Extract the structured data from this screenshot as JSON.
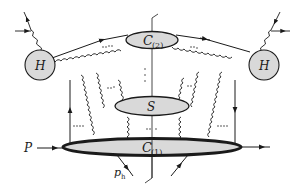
{
  "diagram": {
    "colors": {
      "line": "#1a1a1a",
      "blob_fill": "#d9d9d9",
      "background": "#ffffff"
    },
    "nodes": {
      "hard_left": {
        "label": "H"
      },
      "hard_right": {
        "label": "H"
      },
      "collinear_2": {
        "label": "C",
        "subscript": "(2)"
      },
      "soft": {
        "label": "S"
      },
      "collinear_1": {
        "label": "C",
        "subscript": "(1)"
      }
    },
    "external_labels": {
      "incoming_proton": "P",
      "hadron": "p",
      "hadron_subscript": "h"
    },
    "ellipsis": "..."
  }
}
